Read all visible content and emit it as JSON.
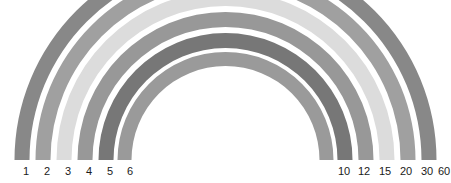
{
  "figure": {
    "title": "",
    "background_color": "#ffffff",
    "width": 451,
    "height": 183
  },
  "chart_data": {
    "type": "pie",
    "subtype": "semicircular-concentric-arc-bands",
    "title": "",
    "subtitle": "",
    "xlabel": "",
    "ylabel": "",
    "grid": false,
    "legend_position": "none",
    "geometry": {
      "center_x": 225.5,
      "center_y": 160,
      "start_angle_deg": 180,
      "end_angle_deg": 0,
      "sweep_deg": 180,
      "band_count": 6,
      "outer_radius": 211,
      "inner_radius": 100
    },
    "categories": [
      "1",
      "2",
      "3",
      "4",
      "5",
      "6"
    ],
    "left_tick_labels": [
      "1",
      "2",
      "3",
      "4",
      "5",
      "6"
    ],
    "right_tick_labels": [
      "10",
      "12",
      "15",
      "20",
      "30",
      "60"
    ],
    "values": [
      1,
      2,
      3,
      4,
      5,
      6
    ],
    "paired_values": [
      10,
      12,
      15,
      20,
      30,
      60
    ],
    "series": [
      {
        "name": "arc-bands",
        "values": [
          1,
          2,
          3,
          4,
          5,
          6
        ],
        "paired": [
          10,
          12,
          15,
          20,
          30,
          60
        ]
      }
    ],
    "bands": [
      {
        "index": 1,
        "left_label": "1",
        "right_label": "60",
        "color": "#888888",
        "outer_radius": 211,
        "inner_radius": 196,
        "thickness": 15,
        "left_x": 21.5,
        "right_x": 429.5
      },
      {
        "index": 2,
        "left_label": "2",
        "right_label": "30",
        "color": "#a0a0a0",
        "outer_radius": 190,
        "inner_radius": 175,
        "thickness": 15,
        "left_x": 42.5,
        "right_x": 408.5
      },
      {
        "index": 3,
        "left_label": "3",
        "right_label": "20",
        "color": "#dcdcdc",
        "outer_radius": 169,
        "inner_radius": 154,
        "thickness": 15,
        "left_x": 63.5,
        "right_x": 387.5
      },
      {
        "index": 4,
        "left_label": "4",
        "right_label": "15",
        "color": "#989898",
        "outer_radius": 148,
        "inner_radius": 133,
        "thickness": 15,
        "left_x": 84.5,
        "right_x": 366.5
      },
      {
        "index": 5,
        "left_label": "5",
        "right_label": "12",
        "color": "#777777",
        "outer_radius": 127,
        "inner_radius": 112,
        "thickness": 15,
        "left_x": 105.5,
        "right_x": 345.5
      },
      {
        "index": 6,
        "left_label": "6",
        "right_label": "10",
        "color": "#9a9a9a",
        "outer_radius": 108,
        "inner_radius": 94,
        "thickness": 14,
        "left_x": 124.5,
        "right_x": 326.5
      }
    ],
    "axis_labels": {
      "left": [
        {
          "text": "1",
          "x": 26,
          "y": 166
        },
        {
          "text": "2",
          "x": 47,
          "y": 166
        },
        {
          "text": "3",
          "x": 68,
          "y": 166
        },
        {
          "text": "4",
          "x": 89,
          "y": 166
        },
        {
          "text": "5",
          "x": 110,
          "y": 166
        },
        {
          "text": "6",
          "x": 130,
          "y": 166
        }
      ],
      "right": [
        {
          "text": "10",
          "x": 344,
          "y": 166
        },
        {
          "text": "12",
          "x": 364,
          "y": 166
        },
        {
          "text": "15",
          "x": 385,
          "y": 166
        },
        {
          "text": "20",
          "x": 406,
          "y": 166
        },
        {
          "text": "30",
          "x": 427,
          "y": 166
        },
        {
          "text": "60",
          "x": 444,
          "y": 166
        }
      ]
    },
    "ylim": [
      0,
      211
    ],
    "xlim": [
      0,
      451
    ]
  }
}
